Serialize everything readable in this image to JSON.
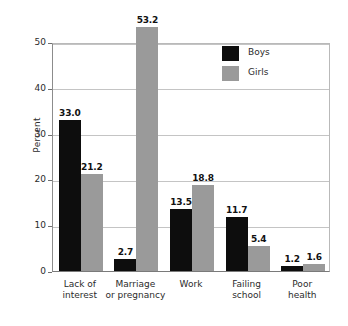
{
  "chart_data": {
    "type": "bar",
    "title": "",
    "subtitle": "",
    "xlabel": "",
    "ylabel": "Percent",
    "ylim": [
      0,
      55
    ],
    "yticks": [
      0,
      10,
      20,
      30,
      40,
      50
    ],
    "ytick_labels": [
      "0",
      "10",
      "20",
      "30",
      "40",
      "50"
    ],
    "grid": true,
    "legend_position": "top-right",
    "categories": [
      "Lack of\ninterest",
      "Marriage\nor pregnancy",
      "Work",
      "Failing\nschool",
      "Poor\nhealth"
    ],
    "series": [
      {
        "name": "Boys",
        "color": "#0d0d0d",
        "values": [
          33.0,
          2.7,
          13.5,
          11.7,
          1.2
        ],
        "labels": [
          "33.0",
          "2.7",
          "13.5",
          "11.7",
          "1.2"
        ]
      },
      {
        "name": "Girls",
        "color": "#9a9a9a",
        "values": [
          21.2,
          53.2,
          18.8,
          5.4,
          1.6
        ],
        "labels": [
          "21.2",
          "53.2",
          "18.8",
          "5.4",
          "1.6"
        ]
      }
    ]
  },
  "legend": {
    "items": [
      {
        "label": "Boys",
        "color": "#0d0d0d"
      },
      {
        "label": "Girls",
        "color": "#9a9a9a"
      }
    ]
  },
  "axis": {
    "y_title": "Percent"
  }
}
